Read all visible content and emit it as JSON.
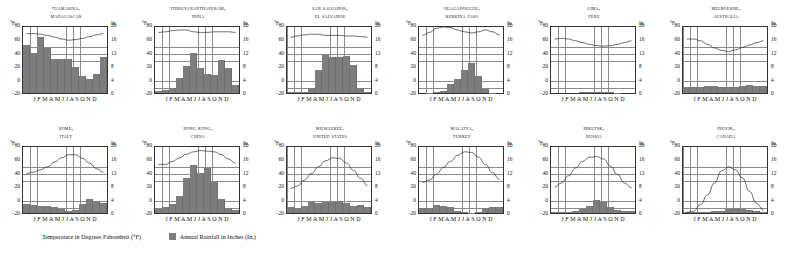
{
  "legend": {
    "temperature_label": "Temperature in Degrees Fahrenheit (°F)",
    "rainfall_label": "Annual Rainfall in Inches (In.)",
    "rainfall_swatch_color": "#7d7d7d"
  },
  "axes": {
    "left_unit": "°F",
    "right_unit": "In.",
    "left_ticks": [
      "80",
      "60",
      "40",
      "20",
      "0",
      "-20"
    ],
    "right_ticks": [
      "20",
      "16",
      "12",
      "8",
      "4",
      "0"
    ],
    "month_labels": "J F M A M J J A S O N D",
    "temp_range": [
      -20,
      90
    ],
    "rain_range": [
      0,
      22
    ]
  },
  "chart_data": {
    "type": "bar",
    "xlabel": "",
    "ylabel": "Temperature (°F) / Rainfall (In.)",
    "categories": [
      "J",
      "F",
      "M",
      "A",
      "M",
      "J",
      "J",
      "A",
      "S",
      "O",
      "N",
      "D"
    ],
    "ylim": [
      -20,
      90
    ],
    "y2lim": [
      0,
      22
    ],
    "grid": true,
    "legend_position": "bottom",
    "panels": [
      {
        "city": "Toamasina,",
        "country": "Madagascar",
        "series": [
          {
            "name": "Annual Rainfall in Inches (In.)",
            "type": "bar",
            "values": [
              15.5,
              13.0,
              18.0,
              14.5,
              11.0,
              11.0,
              11.0,
              8.5,
              5.5,
              4.5,
              6.0,
              11.5
            ]
          },
          {
            "name": "Temperature in Degrees Fahrenheit (°F)",
            "type": "line",
            "values": [
              79,
              79,
              78,
              76,
              73,
              70,
              68,
              69,
              71,
              74,
              77,
              79
            ]
          }
        ]
      },
      {
        "city": "Thiruvananthapuram,",
        "country": "India",
        "series": [
          {
            "name": "Annual Rainfall in Inches (In.)",
            "type": "bar",
            "values": [
              0.8,
              0.9,
              1.7,
              4.9,
              8.6,
              13.0,
              8.0,
              6.0,
              5.8,
              10.6,
              8.0,
              2.7
            ]
          },
          {
            "name": "Temperature in Degrees Fahrenheit (°F)",
            "type": "line",
            "values": [
              81,
              82,
              84,
              85,
              85,
              82,
              81,
              81,
              82,
              82,
              82,
              81
            ]
          }
        ]
      },
      {
        "city": "San Salvador,",
        "country": "El Salvador",
        "series": [
          {
            "name": "Annual Rainfall in Inches (In.)",
            "type": "bar",
            "values": [
              0.3,
              0.2,
              0.4,
              1.7,
              7.6,
              12.2,
              11.5,
              11.8,
              12.0,
              9.2,
              1.6,
              0.4
            ]
          },
          {
            "name": "Temperature in Degrees Fahrenheit (°F)",
            "type": "line",
            "values": [
              73,
              75,
              77,
              78,
              78,
              76,
              76,
              76,
              75,
              75,
              74,
              73
            ]
          }
        ]
      },
      {
        "city": "Ouagadougou,",
        "country": "Burkina Faso",
        "series": [
          {
            "name": "Annual Rainfall in Inches (In.)",
            "type": "bar",
            "values": [
              0.0,
              0.1,
              0.3,
              0.8,
              2.9,
              4.6,
              7.6,
              9.6,
              5.6,
              1.3,
              0.1,
              0.0
            ]
          },
          {
            "name": "Temperature in Degrees Fahrenheit (°F)",
            "type": "line",
            "values": [
              76,
              81,
              88,
              90,
              89,
              85,
              82,
              80,
              82,
              85,
              82,
              77
            ]
          }
        ]
      },
      {
        "city": "Lima,",
        "country": "Peru",
        "series": [
          {
            "name": "Annual Rainfall in Inches (In.)",
            "type": "bar",
            "values": [
              0.0,
              0.0,
              0.0,
              0.0,
              0.2,
              0.2,
              0.3,
              0.3,
              0.3,
              0.1,
              0.0,
              0.0
            ]
          },
          {
            "name": "Temperature in Degrees Fahrenheit (°F)",
            "type": "line",
            "values": [
              70,
              71,
              70,
              67,
              64,
              61,
              59,
              58,
              59,
              61,
              64,
              67
            ]
          }
        ]
      },
      {
        "city": "Melbourne,",
        "country": "Australia",
        "series": [
          {
            "name": "Annual Rainfall in Inches (In.)",
            "type": "bar",
            "values": [
              1.9,
              1.8,
              2.0,
              2.3,
              2.2,
              1.9,
              1.9,
              2.0,
              2.3,
              2.6,
              2.3,
              2.2
            ]
          },
          {
            "name": "Temperature in Degrees Fahrenheit (°F)",
            "type": "line",
            "values": [
              70,
              70,
              67,
              61,
              55,
              51,
              49,
              52,
              56,
              60,
              64,
              67
            ]
          }
        ]
      },
      {
        "city": "Rome,",
        "country": "Italy",
        "series": [
          {
            "name": "Annual Rainfall in Inches (In.)",
            "type": "bar",
            "values": [
              2.8,
              2.6,
              2.4,
              2.2,
              1.8,
              1.2,
              0.8,
              1.0,
              2.8,
              4.4,
              4.0,
              3.4
            ]
          },
          {
            "name": "Temperature in Degrees Fahrenheit (°F)",
            "type": "line",
            "values": [
              46,
              48,
              52,
              57,
              65,
              72,
              77,
              77,
              71,
              63,
              54,
              48
            ]
          }
        ]
      },
      {
        "city": "Hong Kong,",
        "country": "China",
        "series": [
          {
            "name": "Annual Rainfall in Inches (In.)",
            "type": "bar",
            "values": [
              1.3,
              1.8,
              2.9,
              5.4,
              11.4,
              15.6,
              12.8,
              14.6,
              10.0,
              4.5,
              1.7,
              1.1
            ]
          },
          {
            "name": "Temperature in Degrees Fahrenheit (°F)",
            "type": "line",
            "values": [
              61,
              61,
              66,
              72,
              78,
              82,
              84,
              83,
              82,
              77,
              70,
              63
            ]
          }
        ]
      },
      {
        "city": "Milwaukee,",
        "country": "United States",
        "series": [
          {
            "name": "Annual Rainfall in Inches (In.)",
            "type": "bar",
            "values": [
              1.8,
              1.5,
              2.3,
              3.6,
              3.1,
              3.5,
              3.6,
              4.0,
              3.2,
              2.3,
              2.5,
              2.1
            ]
          },
          {
            "name": "Temperature in Degrees Fahrenheit (°F)",
            "type": "line",
            "values": [
              21,
              25,
              35,
              46,
              57,
              67,
              72,
              71,
              63,
              51,
              38,
              26
            ]
          }
        ]
      },
      {
        "city": "Malatya,",
        "country": "Turkey",
        "series": [
          {
            "name": "Annual Rainfall in Inches (In.)",
            "type": "bar",
            "values": [
              1.6,
              1.6,
              2.5,
              2.4,
              1.8,
              0.5,
              0.2,
              0.1,
              0.3,
              1.6,
              1.8,
              2.0
            ]
          },
          {
            "name": "Temperature in Degrees Fahrenheit (°F)",
            "type": "line",
            "values": [
              31,
              35,
              45,
              56,
              66,
              76,
              82,
              81,
              73,
              61,
              47,
              36
            ]
          }
        ]
      },
      {
        "city": "Irkutsk,",
        "country": "Russia",
        "series": [
          {
            "name": "Annual Rainfall in Inches (In.)",
            "type": "bar",
            "values": [
              0.4,
              0.3,
              0.4,
              0.7,
              1.3,
              2.3,
              4.2,
              3.5,
              2.0,
              1.0,
              0.7,
              0.6
            ]
          },
          {
            "name": "Temperature in Degrees Fahrenheit (°F)",
            "type": "line",
            "values": [
              23,
              30,
              42,
              55,
              66,
              73,
              74,
              70,
              58,
              44,
              30,
              22
            ]
          }
        ]
      },
      {
        "city": "Inuvik,",
        "country": "Canada",
        "series": [
          {
            "name": "Annual Rainfall in Inches (In.)",
            "type": "bar",
            "values": [
              0.2,
              0.2,
              0.2,
              0.3,
              0.5,
              0.8,
              1.3,
              1.7,
              1.2,
              1.1,
              0.6,
              0.3
            ]
          },
          {
            "name": "Temperature in Degrees Fahrenheit (°F)",
            "type": "line",
            "values": [
              -19,
              -17,
              -6,
              10,
              30,
              50,
              57,
              52,
              38,
              16,
              -4,
              -15
            ]
          }
        ]
      }
    ]
  }
}
